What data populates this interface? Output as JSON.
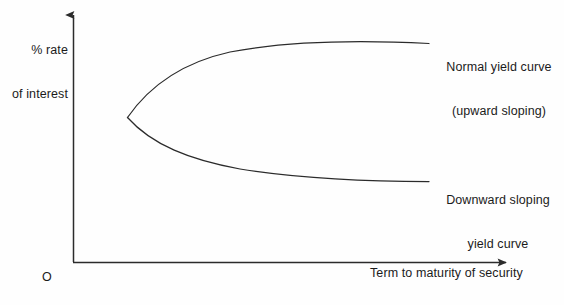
{
  "figure": {
    "background_color": "#fefefe",
    "stroke_color": "#2b2b2b",
    "text_color": "#1b1b1b"
  },
  "axes": {
    "y_label_line1": "% rate",
    "y_label_line2": "of interest",
    "x_label": "Term to maturity of security",
    "origin_label": "O"
  },
  "annotations": {
    "normal_line1": "Normal yield curve",
    "normal_line2": "(upward sloping)",
    "downward_line1": "Downward sloping",
    "downward_line2": "yield curve"
  },
  "chart_data": {
    "type": "line",
    "title": "",
    "xlabel": "Term to maturity of security",
    "ylabel": "% rate of interest",
    "grid": false,
    "legend": false,
    "axis_style": "arrow-axes-unlabeled-ticks",
    "origin_label": "O",
    "xlim": [
      0,
      100
    ],
    "ylim": [
      0,
      100
    ],
    "note": "Schematic yield curve diagram: two curves emanate from a common cusp point and diverge, one sloping upward (normal) and one sloping downward (inverted).",
    "cusp_point": {
      "x": 12.3,
      "y": 59.2
    },
    "series": [
      {
        "name": "Normal yield curve (upward sloping)",
        "label_line1": "Normal yield curve",
        "label_line2": "(upward sloping)",
        "direction": "upward",
        "points": [
          {
            "x": 12.3,
            "y": 59.2
          },
          {
            "x": 15.0,
            "y": 67.0
          },
          {
            "x": 19.0,
            "y": 73.5
          },
          {
            "x": 25.0,
            "y": 79.0
          },
          {
            "x": 33.0,
            "y": 83.0
          },
          {
            "x": 43.0,
            "y": 86.0
          },
          {
            "x": 55.0,
            "y": 88.3
          },
          {
            "x": 68.0,
            "y": 90.2
          },
          {
            "x": 80.5,
            "y": 91.8
          },
          {
            "x": 90.5,
            "y": 93.0
          }
        ]
      },
      {
        "name": "Downward sloping yield curve",
        "label_line1": "Downward sloping",
        "label_line2": "yield curve",
        "direction": "downward",
        "points": [
          {
            "x": 12.3,
            "y": 59.2
          },
          {
            "x": 15.0,
            "y": 52.5
          },
          {
            "x": 19.0,
            "y": 46.5
          },
          {
            "x": 25.0,
            "y": 41.0
          },
          {
            "x": 33.0,
            "y": 36.5
          },
          {
            "x": 43.0,
            "y": 33.0
          },
          {
            "x": 55.0,
            "y": 30.2
          },
          {
            "x": 68.0,
            "y": 28.2
          },
          {
            "x": 80.5,
            "y": 26.8
          },
          {
            "x": 90.5,
            "y": 26.0
          }
        ]
      }
    ]
  },
  "geometry": {
    "y_axis": {
      "x": 73,
      "y_bottom": 262,
      "y_top": 8
    },
    "x_axis": {
      "y": 262,
      "x_left": 73,
      "x_right": 514
    },
    "upper_curve_path": "M 127.5 117.5 C 150 85, 185 62, 230 52 C 285 41.5, 360 40, 429 43.5",
    "lower_curve_path": "M 127.5 117.5 C 152 145, 190 160, 240 169 C 300 178.5, 372 181.5, 429 181.5"
  }
}
